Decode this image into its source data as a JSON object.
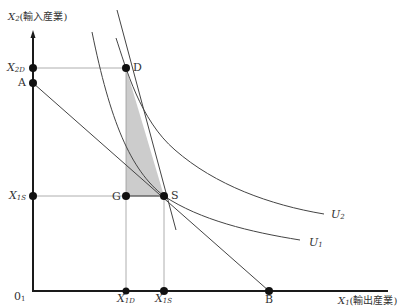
{
  "diagram": {
    "axes": {
      "y_axis_symbol": "X",
      "y_axis_sub": "2",
      "y_axis_label": "(輸入産業)",
      "x_axis_symbol": "X",
      "x_axis_sub": "1",
      "x_axis_label": "(輸出産業)",
      "origin_label": "0",
      "origin_sub": "1"
    },
    "points": {
      "D": "D",
      "S": "S",
      "G": "G",
      "A": "A",
      "B": "B"
    },
    "y_ticks": [
      {
        "symbol": "X",
        "sub": "2D"
      },
      {
        "symbol": "X",
        "sub": "1S"
      }
    ],
    "x_ticks": [
      {
        "symbol": "X",
        "sub": "1D"
      },
      {
        "symbol": "X",
        "sub": "1S"
      }
    ],
    "curves": {
      "u2": {
        "symbol": "U",
        "sub": "2"
      },
      "u1": {
        "symbol": "U",
        "sub": "1"
      }
    },
    "colors": {
      "axis": "#1a1a1a",
      "line": "#444444",
      "guide": "#9a9a9a",
      "shade": "#cccccc",
      "point": "#111111"
    }
  }
}
